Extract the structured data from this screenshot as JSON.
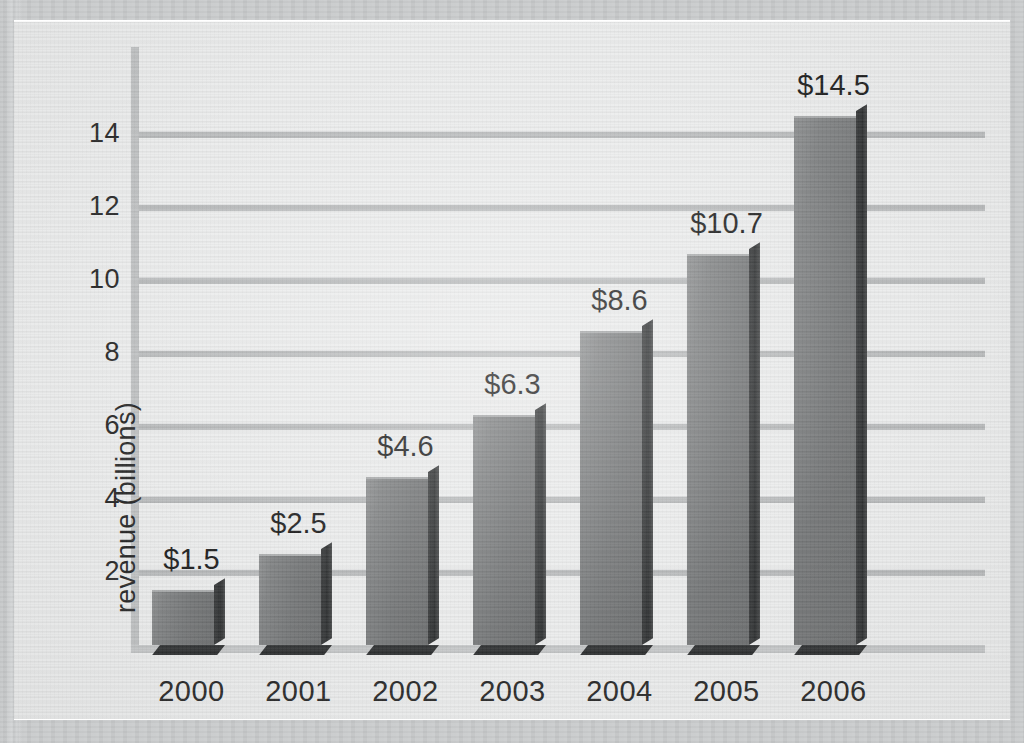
{
  "chart_data": {
    "type": "bar",
    "title": "",
    "subtitle": "",
    "xlabel": "",
    "ylabel": "revenue (billions)",
    "categories": [
      "2000",
      "2001",
      "2002",
      "2003",
      "2004",
      "2005",
      "2006"
    ],
    "values": [
      1.5,
      2.5,
      4.6,
      6.3,
      8.6,
      10.7,
      14.5
    ],
    "data_labels": [
      "$1.5",
      "$2.5",
      "$4.6",
      "$6.3",
      "$8.6",
      "$10.7",
      "$14.5"
    ],
    "ytick_labels": [
      "2",
      "4",
      "6",
      "8",
      "10",
      "12",
      "14"
    ],
    "ytick_values": [
      2,
      4,
      6,
      8,
      10,
      12,
      14
    ],
    "ylim": [
      0,
      15.3
    ],
    "grid": "horizontal",
    "legend": "none",
    "style": "3d-bar",
    "colors": {
      "bar_face": "#7a7c7d",
      "bar_side": "#333536",
      "bar_shadow": "#2e3031",
      "gridline": "#b9bbbc",
      "axis": "#c0c2c3",
      "plot_background": "#eceded",
      "page_margin": "#cfd1d2",
      "text": "#2a2a2a"
    }
  }
}
